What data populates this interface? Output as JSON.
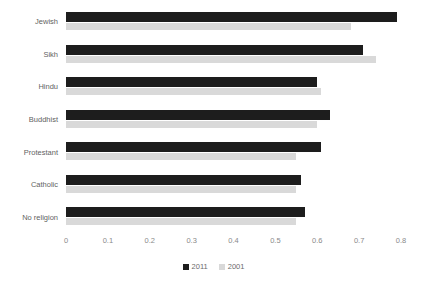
{
  "chart_data": {
    "type": "bar",
    "orientation": "horizontal",
    "title": "",
    "subtitle": "",
    "xlabel": "",
    "ylabel": "",
    "categories": [
      "Jewish",
      "Sikh",
      "Hindu",
      "Buddhist",
      "Protestant",
      "Catholic",
      "No religion"
    ],
    "series": [
      {
        "name": "2011",
        "color": "#1d1d1d",
        "values": [
          0.79,
          0.71,
          0.6,
          0.63,
          0.61,
          0.56,
          0.57
        ]
      },
      {
        "name": "2001",
        "color": "#d9d9d9",
        "values": [
          0.68,
          0.74,
          0.61,
          0.6,
          0.55,
          0.55,
          0.55
        ]
      }
    ],
    "xlim": [
      0,
      0.8
    ],
    "xticks": [
      0,
      0.1,
      0.2,
      0.3,
      0.4,
      0.5,
      0.6,
      0.7,
      0.8
    ],
    "xtick_labels": [
      "0",
      "0.1",
      "0.2",
      "0.3",
      "0.4",
      "0.5",
      "0.6",
      "0.7",
      "0.8"
    ],
    "grid": false,
    "legend_position": "bottom",
    "legend_entries": [
      "2011",
      "2001"
    ]
  }
}
